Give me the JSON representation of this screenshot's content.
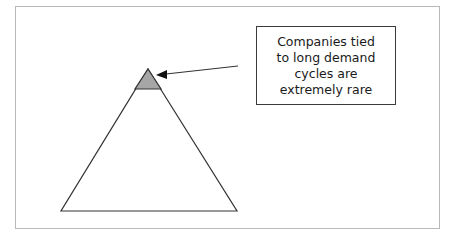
{
  "diagram": {
    "type": "pyramid-callout",
    "callout": {
      "text": "Companies tied\nto long demand\ncycles are\nextremely rare"
    },
    "colors": {
      "apex_fill": "#a6a6a6",
      "lines": "#333333",
      "frame": "#b8b8b8"
    }
  }
}
